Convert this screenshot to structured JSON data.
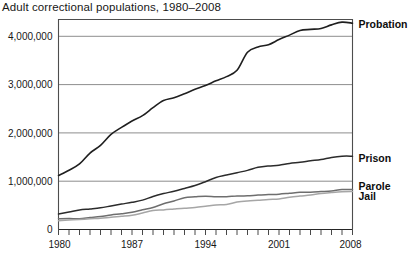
{
  "chart_data": {
    "type": "line",
    "title": "Adult correctional populations, 1980–2008",
    "xlabel": "",
    "ylabel": "",
    "xlim": [
      1980,
      2008
    ],
    "ylim": [
      0,
      4400000
    ],
    "grid": true,
    "legend_position": "right-inline",
    "y_ticks": [
      0,
      1000000,
      2000000,
      3000000,
      4000000
    ],
    "y_tick_labels": [
      "0",
      "1,000,000",
      "2,000,000",
      "3,000,000",
      "4,000,000"
    ],
    "x_ticks": [
      1980,
      1981,
      1982,
      1983,
      1984,
      1985,
      1986,
      1987,
      1988,
      1989,
      1990,
      1991,
      1992,
      1993,
      1994,
      1995,
      1996,
      1997,
      1998,
      1999,
      2000,
      2001,
      2002,
      2003,
      2004,
      2005,
      2006,
      2007,
      2008
    ],
    "x_tick_labels": [
      "1980",
      "1987",
      "1994",
      "2001",
      "2008"
    ],
    "x_tick_label_years": [
      1980,
      1987,
      1994,
      2001,
      2008
    ],
    "x": [
      1980,
      1981,
      1982,
      1983,
      1984,
      1985,
      1986,
      1987,
      1988,
      1989,
      1990,
      1991,
      1992,
      1993,
      1994,
      1995,
      1996,
      1997,
      1998,
      1999,
      2000,
      2001,
      2002,
      2003,
      2004,
      2005,
      2006,
      2007,
      2008
    ],
    "series": [
      {
        "name": "Probation",
        "color": "#1f1f1f",
        "width": 1.6,
        "values": [
          1118097,
          1225934,
          1357264,
          1582947,
          1740948,
          1968712,
          2114621,
          2247158,
          2356483,
          2522125,
          2670234,
          2728472,
          2811611,
          2903061,
          2981022,
          3077861,
          3164996,
          3296513,
          3670441,
          3779922,
          3826209,
          3931731,
          4024067,
          4120012,
          4143792,
          4162536,
          4236800,
          4293163,
          4270917
        ]
      },
      {
        "name": "Prison",
        "color": "#2b2b2b",
        "width": 1.5,
        "values": [
          319598,
          360029,
          402914,
          423898,
          448264,
          487593,
          526436,
          562814,
          607766,
          683367,
          743382,
          792535,
          850566,
          909381,
          990147,
          1078542,
          1127528,
          1176564,
          1224469,
          1287172,
          1316333,
          1330007,
          1367547,
          1390279,
          1421345,
          1448344,
          1492973,
          1517867,
          1518559
        ]
      },
      {
        "name": "Parole",
        "color": "#6e6e6e",
        "width": 1.5,
        "values": [
          220438,
          225539,
          224604,
          246440,
          266992,
          300203,
          325638,
          355505,
          407977,
          456803,
          531407,
          590442,
          658601,
          676100,
          690371,
          679421,
          679733,
          694787,
          696385,
          714457,
          723898,
          732333,
          750934,
          769925,
          771852,
          784408,
          798202,
          826097,
          828169
        ]
      },
      {
        "name": "Jail",
        "color": "#a6a6a6",
        "width": 1.5,
        "values": [
          182288,
          195085,
          207853,
          221815,
          233018,
          254986,
          272736,
          294092,
          341893,
          393303,
          405320,
          424129,
          441781,
          455500,
          479800,
          507044,
          518492,
          567079,
          592462,
          605943,
          621149,
          631240,
          665475,
          691301,
          713990,
          747529,
          765819,
          780174,
          785556
        ]
      }
    ],
    "annotations": [
      {
        "text": "Probation",
        "series": "Probation",
        "at_year": 2008
      },
      {
        "text": "Prison",
        "series": "Prison",
        "at_year": 2008
      },
      {
        "text": "Parole",
        "series": "Parole",
        "at_year": 2008
      },
      {
        "text": "Jail",
        "series": "Jail",
        "at_year": 2008
      }
    ],
    "colors": {
      "axis": "#4d4d4d",
      "grid": "#808080",
      "background": "#ffffff",
      "text": "#171717"
    }
  }
}
